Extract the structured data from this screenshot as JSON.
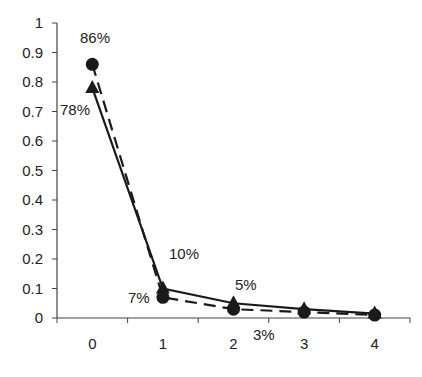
{
  "chart_data": {
    "type": "line",
    "title": "",
    "xlabel": "",
    "ylabel": "",
    "categories": [
      "0",
      "1",
      "2",
      "3",
      "4"
    ],
    "ylim": [
      0,
      1
    ],
    "yticks": [
      "0",
      "0.1",
      "0.2",
      "0.3",
      "0.4",
      "0.5",
      "0.6",
      "0.7",
      "0.8",
      "0.9",
      "1"
    ],
    "grid": false,
    "legend": null,
    "series": [
      {
        "name": "circle-dashed",
        "marker": "circle",
        "line_style": "dashed",
        "values": [
          0.86,
          0.07,
          0.03,
          0.02,
          0.01
        ]
      },
      {
        "name": "triangle-solid",
        "marker": "triangle",
        "line_style": "solid",
        "values": [
          0.78,
          0.1,
          0.05,
          0.03,
          0.015
        ]
      }
    ],
    "annotations": [
      {
        "text": "86%",
        "series": "circle-dashed",
        "category": "0"
      },
      {
        "text": "78%",
        "series": "triangle-solid",
        "category": "0"
      },
      {
        "text": "10%",
        "series": "triangle-solid",
        "category": "1"
      },
      {
        "text": "7%",
        "series": "circle-dashed",
        "category": "1"
      },
      {
        "text": "5%",
        "series": "triangle-solid",
        "category": "2"
      },
      {
        "text": "3%",
        "series": "circle-dashed",
        "category": "2"
      }
    ]
  },
  "labels": {
    "a86": "86%",
    "a78": "78%",
    "a10": "10%",
    "a7": "7%",
    "a5": "5%",
    "a3": "3%"
  },
  "colors": {
    "ink": "#1a1a1a",
    "axis": "#444444"
  }
}
